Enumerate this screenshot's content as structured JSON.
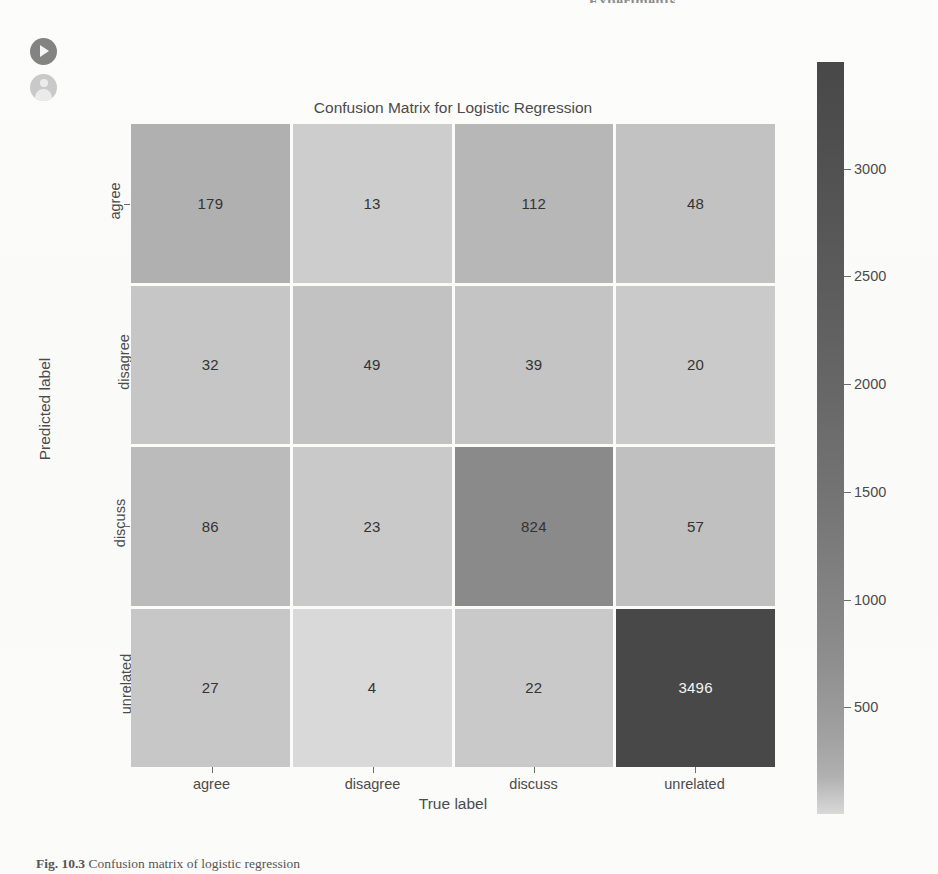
{
  "page": {
    "running_head": "Experiments",
    "caption_prefix": "Fig. 10.3",
    "caption_text": "Confusion matrix of logistic regression"
  },
  "overlay": {
    "play_icon": "play-circle-icon",
    "user_icon": "user-avatar-icon"
  },
  "chart_data": {
    "type": "heatmap",
    "title": "Confusion Matrix for Logistic Regression",
    "xlabel": "True label",
    "ylabel": "Predicted label",
    "categories_x": [
      "agree",
      "disagree",
      "discuss",
      "unrelated"
    ],
    "categories_y": [
      "agree",
      "disagree",
      "discuss",
      "unrelated"
    ],
    "values": [
      [
        179,
        13,
        112,
        48
      ],
      [
        32,
        49,
        39,
        20
      ],
      [
        86,
        23,
        824,
        57
      ],
      [
        27,
        4,
        22,
        3496
      ]
    ],
    "colorbar": {
      "ticks": [
        3000,
        2500,
        2000,
        1500,
        1000,
        500
      ],
      "vmin": 4,
      "vmax": 3496,
      "colormap": "grayscale-reversed",
      "low_color": "#d7d7d7",
      "high_color": "#4c4c4c"
    },
    "grid": false,
    "legend": "colorbar-right"
  }
}
